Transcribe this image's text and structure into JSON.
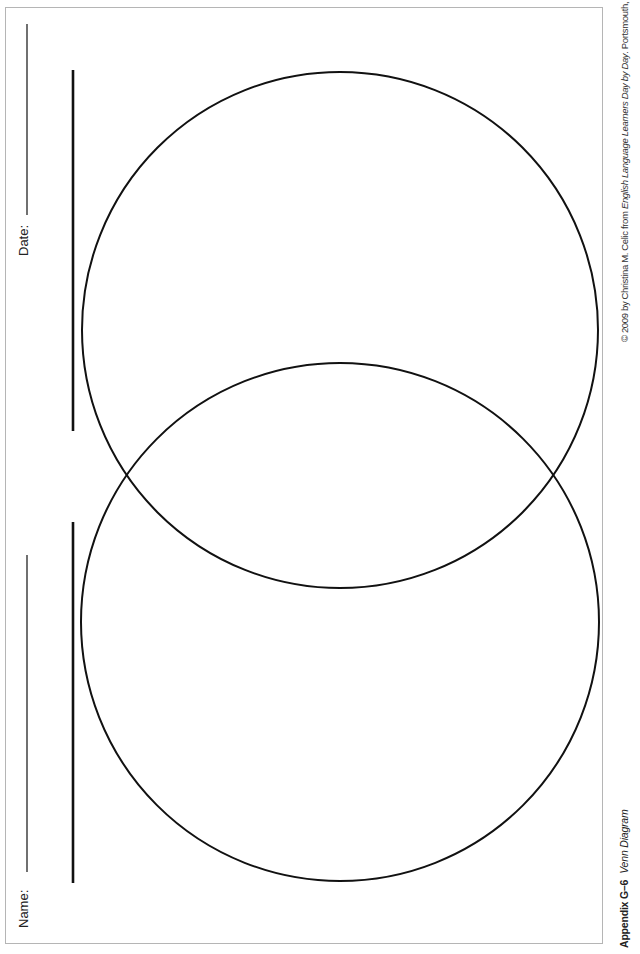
{
  "form": {
    "name_label": "Name:",
    "date_label": "Date:"
  },
  "diagram": {
    "type": "Venn Diagram",
    "circles": [
      {
        "id": "top",
        "cx": 340,
        "cy": 330,
        "r": 258
      },
      {
        "id": "bottom",
        "cx": 340,
        "cy": 622,
        "r": 259
      }
    ],
    "stroke_color": "#111111",
    "frame_color": "#b5b5b5"
  },
  "footer": {
    "appendix_id": "Appendix G–6",
    "appendix_title": "Venn Diagram",
    "copyright_prefix": "© 2009 by Christina M. Celic from ",
    "book_title": "English Language Learners Day by Day",
    "copyright_suffix": ". Portsmouth, NH: Heinemann."
  }
}
